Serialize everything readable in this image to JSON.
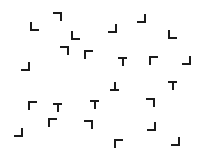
{
  "canvas": {
    "width": 206,
    "height": 159,
    "background": "#ffffff",
    "ink": "#1a1a1a"
  },
  "glyphs": [
    {
      "x": 30,
      "y": 22,
      "shape": "L",
      "segments": [
        "left",
        "bottom"
      ]
    },
    {
      "x": 53,
      "y": 12,
      "shape": "L-rot180",
      "segments": [
        "top",
        "right"
      ]
    },
    {
      "x": 71,
      "y": 31,
      "shape": "L",
      "segments": [
        "left",
        "bottom"
      ]
    },
    {
      "x": 60,
      "y": 46,
      "shape": "L-rot180",
      "segments": [
        "top",
        "right"
      ]
    },
    {
      "x": 84,
      "y": 50,
      "shape": "L-rot90",
      "segments": [
        "left",
        "top"
      ]
    },
    {
      "x": 21,
      "y": 62,
      "shape": "L-rot270",
      "segments": [
        "right",
        "bottom"
      ]
    },
    {
      "x": 108,
      "y": 24,
      "shape": "L-rot270",
      "segments": [
        "right",
        "bottom"
      ]
    },
    {
      "x": 137,
      "y": 14,
      "shape": "L-rot270",
      "segments": [
        "right",
        "bottom"
      ]
    },
    {
      "x": 168,
      "y": 30,
      "shape": "L",
      "segments": [
        "left",
        "bottom"
      ]
    },
    {
      "x": 118,
      "y": 57,
      "shape": "T",
      "segments": [
        "top",
        "vcenter"
      ]
    },
    {
      "x": 149,
      "y": 56,
      "shape": "L-rot90",
      "segments": [
        "left",
        "top"
      ]
    },
    {
      "x": 182,
      "y": 56,
      "shape": "L-rot270",
      "segments": [
        "right",
        "bottom"
      ]
    },
    {
      "x": 110,
      "y": 82,
      "shape": "T-inverted",
      "segments": [
        "bottom",
        "vcenter"
      ]
    },
    {
      "x": 168,
      "y": 81,
      "shape": "T",
      "segments": [
        "top",
        "vcenter"
      ]
    },
    {
      "x": 146,
      "y": 98,
      "shape": "L-rot180",
      "segments": [
        "top",
        "right"
      ]
    },
    {
      "x": 28,
      "y": 101,
      "shape": "L-rot90",
      "segments": [
        "left",
        "top"
      ]
    },
    {
      "x": 53,
      "y": 103,
      "shape": "T",
      "segments": [
        "top",
        "vcenter"
      ]
    },
    {
      "x": 90,
      "y": 100,
      "shape": "T",
      "segments": [
        "top",
        "vcenter"
      ]
    },
    {
      "x": 14,
      "y": 128,
      "shape": "L-rot270",
      "segments": [
        "right",
        "bottom"
      ]
    },
    {
      "x": 48,
      "y": 118,
      "shape": "L-rot90",
      "segments": [
        "left",
        "top"
      ]
    },
    {
      "x": 84,
      "y": 120,
      "shape": "L-rot180",
      "segments": [
        "top",
        "right"
      ]
    },
    {
      "x": 147,
      "y": 122,
      "shape": "L-rot270",
      "segments": [
        "right",
        "bottom"
      ]
    },
    {
      "x": 114,
      "y": 139,
      "shape": "L-rot90",
      "segments": [
        "left",
        "top"
      ]
    },
    {
      "x": 171,
      "y": 137,
      "shape": "L-rot270",
      "segments": [
        "right",
        "bottom"
      ]
    }
  ]
}
